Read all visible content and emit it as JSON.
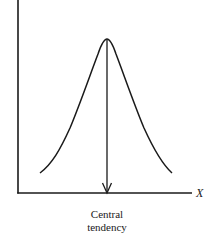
{
  "diagram": {
    "x_axis_label": "X",
    "caption_line1": "Central",
    "caption_line2": "tendency",
    "colors": {
      "stroke": "#1a1a1a",
      "background": "#ffffff"
    },
    "elements": [
      {
        "type": "axis",
        "name": "y-axis",
        "from": [
          18,
          0
        ],
        "to": [
          18,
          193
        ]
      },
      {
        "type": "axis",
        "name": "x-axis",
        "from": [
          18,
          193
        ],
        "to": [
          192,
          193
        ]
      },
      {
        "type": "curve",
        "name": "bell-curve",
        "shape": "normal",
        "start": [
          40,
          173
        ],
        "peak": [
          107,
          39
        ],
        "end": [
          172,
          173
        ]
      },
      {
        "type": "arrow",
        "name": "central-tendency-arrow",
        "from": [
          107,
          39
        ],
        "to": [
          107,
          193
        ]
      }
    ]
  }
}
